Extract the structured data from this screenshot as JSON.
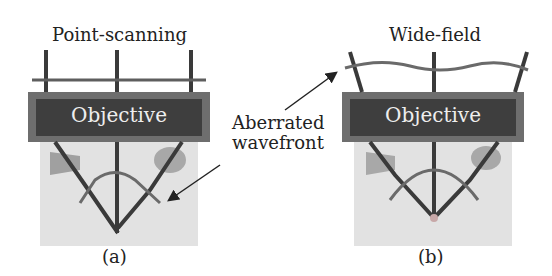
{
  "panels": [
    {
      "id": "a",
      "title": "Point-scanning",
      "objective_label": "Objective",
      "caption": "(a)"
    },
    {
      "id": "b",
      "title": "Wide-field",
      "objective_label": "Objective",
      "caption": "(b)"
    }
  ],
  "annotation": {
    "line1": "Aberrated",
    "line2": "wavefront"
  },
  "colors": {
    "objective_outer": "#6e6e6e",
    "objective_inner": "#3e3e3e",
    "sample": "#e2e2e2",
    "ray": "#3a3a3a",
    "wavefront": "#7a7a7a"
  }
}
